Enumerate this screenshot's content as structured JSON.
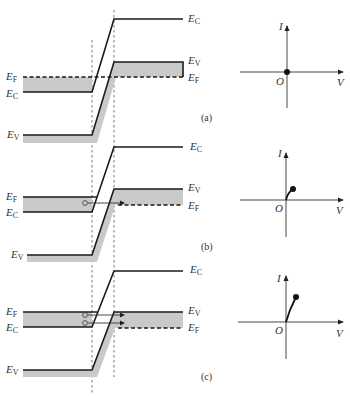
{
  "figure": {
    "colors": {
      "line": "#1a1a1a",
      "shade": "#c9c9c9",
      "background": "#ffffff"
    },
    "level_symbol": "E",
    "axis_labels": {
      "current": "I",
      "voltage": "V",
      "origin": "O"
    },
    "panels": [
      {
        "id": "a",
        "caption": "(a)",
        "left_labels": [
          {
            "base": "E",
            "sub": "F"
          },
          {
            "base": "E",
            "sub": "C"
          },
          {
            "base": "E",
            "sub": "V"
          }
        ],
        "right_labels": [
          {
            "base": "E",
            "sub": "C"
          },
          {
            "base": "E",
            "sub": "V"
          },
          {
            "base": "E",
            "sub": "F"
          }
        ],
        "electrons_tunneling": 0,
        "iv_point": "origin"
      },
      {
        "id": "b",
        "caption": "(b)",
        "left_labels": [
          {
            "base": "E",
            "sub": "F"
          },
          {
            "base": "E",
            "sub": "C"
          },
          {
            "base": "E",
            "sub": "V"
          }
        ],
        "right_labels": [
          {
            "base": "E",
            "sub": "C"
          },
          {
            "base": "E",
            "sub": "V"
          },
          {
            "base": "E",
            "sub": "F"
          }
        ],
        "electrons_tunneling": 1,
        "iv_point": "small forward bias, small current"
      },
      {
        "id": "c",
        "caption": "(c)",
        "left_labels": [
          {
            "base": "E",
            "sub": "F"
          },
          {
            "base": "E",
            "sub": "C"
          },
          {
            "base": "E",
            "sub": "V"
          }
        ],
        "right_labels": [
          {
            "base": "E",
            "sub": "C"
          },
          {
            "base": "E",
            "sub": "V"
          },
          {
            "base": "E",
            "sub": "F"
          }
        ],
        "electrons_tunneling": 2,
        "iv_point": "larger forward bias, larger current"
      }
    ]
  }
}
